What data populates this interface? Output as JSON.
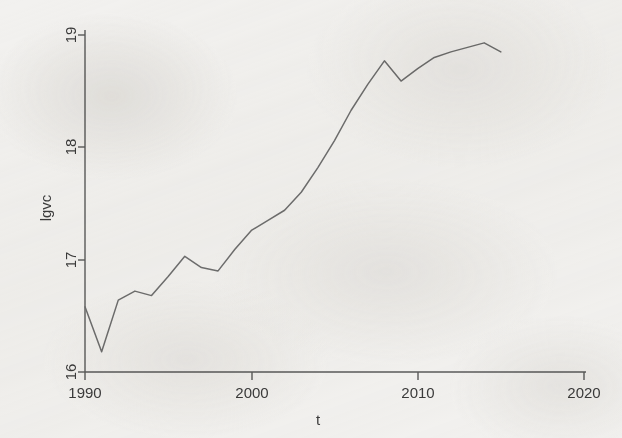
{
  "figure": {
    "background_color": "#f2f1ef",
    "line_color": "#6e6e6e",
    "axis_color": "#5a5a5a",
    "text_color": "#3b3b3b"
  },
  "chart_data": {
    "type": "line",
    "title": "",
    "xlabel": "t",
    "ylabel": "lgvc",
    "xlim": [
      1990,
      2020
    ],
    "ylim": [
      16,
      19
    ],
    "xticks": [
      1990,
      2000,
      2010,
      2020
    ],
    "xtick_labels": [
      "1990",
      "2000",
      "2010",
      "2020"
    ],
    "yticks": [
      16,
      17,
      18,
      19
    ],
    "ytick_labels": [
      "16",
      "17",
      "18",
      "19"
    ],
    "grid": false,
    "legend": false,
    "legend_position": "none",
    "series": [
      {
        "name": "lgvc",
        "x": [
          1990,
          1991,
          1992,
          1993,
          1994,
          1995,
          1996,
          1997,
          1998,
          1999,
          2000,
          2001,
          2002,
          2003,
          2004,
          2005,
          2006,
          2007,
          2008,
          2009,
          2010,
          2011,
          2012,
          2013,
          2014,
          2015
        ],
        "values": [
          16.58,
          16.18,
          16.64,
          16.72,
          16.68,
          16.85,
          17.03,
          16.93,
          16.9,
          17.09,
          17.26,
          17.35,
          17.44,
          17.6,
          17.82,
          18.06,
          18.33,
          18.56,
          18.77,
          18.59,
          18.7,
          18.8,
          18.85,
          18.89,
          18.93,
          18.85
        ]
      }
    ]
  },
  "axis": {
    "y_label_text": "lgvc",
    "x_label_text": "t"
  }
}
